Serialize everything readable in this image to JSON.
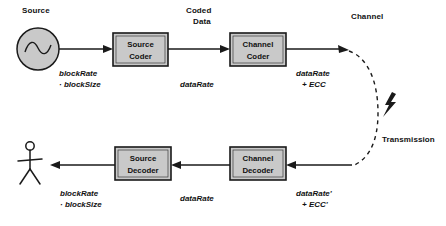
{
  "diagram": {
    "title_headings": [
      {
        "name": "source",
        "text": "Source",
        "x": 22,
        "y": 6
      },
      {
        "name": "coded-data-line1",
        "text": "Coded",
        "x": 186,
        "y": 6
      },
      {
        "name": "coded-data-line2",
        "text": "Data",
        "x": 193,
        "y": 17
      },
      {
        "name": "channel",
        "text": "Channel",
        "x": 351,
        "y": 12
      },
      {
        "name": "transmission",
        "text": "Transmission",
        "x": 382,
        "y": 135
      }
    ],
    "blocks": [
      {
        "name": "source-coder",
        "line1": "Source",
        "line2": "Coder",
        "x": 113,
        "y": 33,
        "w": 55,
        "h": 33
      },
      {
        "name": "channel-coder",
        "line1": "Channel",
        "line2": "Coder",
        "x": 230,
        "y": 33,
        "w": 56,
        "h": 33
      },
      {
        "name": "source-decoder",
        "line1": "Source",
        "line2": "Decoder",
        "x": 115,
        "y": 147,
        "w": 56,
        "h": 33
      },
      {
        "name": "channel-decoder",
        "line1": "Channel",
        "line2": "Decoder",
        "x": 230,
        "y": 147,
        "w": 56,
        "h": 33
      }
    ],
    "annotations": [
      {
        "name": "annot-source-rate",
        "line1": "blockRate",
        "line2": "· blockSize",
        "x": 59,
        "y": 68
      },
      {
        "name": "annot-coded-rate",
        "line1": "dataRate",
        "line2": "",
        "x": 180,
        "y": 79
      },
      {
        "name": "annot-channel-rate",
        "line1": "dataRate",
        "line2": "+ ECC",
        "x": 296,
        "y": 68
      },
      {
        "name": "annot-decoded-source-rate",
        "line1": "blockRate",
        "line2": "· blockSize",
        "x": 60,
        "y": 188
      },
      {
        "name": "annot-decoded-data-rate",
        "line1": "dataRate",
        "line2": "",
        "x": 180,
        "y": 193
      },
      {
        "name": "annot-received-rate",
        "line1": "dataRate'",
        "line2": "+ ECC'",
        "x": 296,
        "y": 188
      }
    ],
    "icons": {
      "source_signal": "sine-wave-circle-icon",
      "receiver": "stick-figure-icon",
      "noise": "lightning-bolt-icon"
    },
    "colors": {
      "block_fill": "#c9c9c9",
      "stroke": "#1a1a1a",
      "background": "#ffffff"
    }
  }
}
